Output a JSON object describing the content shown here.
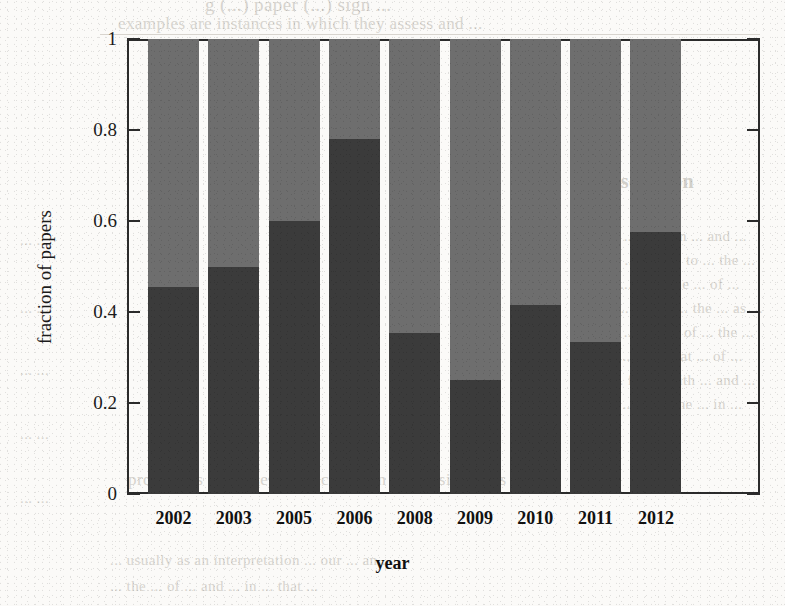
{
  "page": {
    "background_color": "#fbfaf8",
    "bleed_through_text": [
      "g (...) paper (...) sign ...",
      "examples are instances in which they assess and ...",
      "Discussion",
      "the ... of ... in ... and ...",
      "ing ... that ... to ... the ...",
      "do ... in ... the ... of ...",
      "in ... which ... the ... as ...",
      "the ... and ... of ... the ...",
      "us ... to ... that ... of ...",
      "a ... for ... with ... and ...",
      "we ... of ... the ... in ...",
      "provide us with useful indicators on conclusions this",
      "... usually as an interpretation ... our ... an ...",
      "... the ... of ... and ... in ... that ...",
      "... ...",
      "... ...",
      "... ...",
      "... ...",
      "... ..."
    ]
  },
  "chart_data": {
    "type": "bar",
    "subtype": "stacked-fraction",
    "title": "",
    "xlabel": "year",
    "ylabel": "fraction of papers",
    "categories": [
      "2002",
      "2003",
      "2005",
      "2006",
      "2008",
      "2009",
      "2010",
      "2011",
      "2012"
    ],
    "ylim": [
      0,
      1
    ],
    "yticks": [
      "0",
      "0.2",
      "0.4",
      "0.6",
      "0.8",
      "1"
    ],
    "ytick_values": [
      0,
      0.2,
      0.4,
      0.6,
      0.8,
      1
    ],
    "grid": false,
    "legend": "none",
    "series": [
      {
        "name": "lower-segment",
        "color": "#3b3b3b",
        "values": [
          0.455,
          0.5,
          0.6,
          0.78,
          0.353,
          0.25,
          0.415,
          0.335,
          0.575
        ]
      },
      {
        "name": "upper-segment",
        "color": "#6e6e6e",
        "values": [
          0.545,
          0.5,
          0.4,
          0.22,
          0.647,
          0.75,
          0.585,
          0.665,
          0.425
        ]
      }
    ],
    "axis_color": "#2b2b2b",
    "bar_edge_note": "bars separated by white gaps; frame drawn on all four sides with inward ticks"
  }
}
